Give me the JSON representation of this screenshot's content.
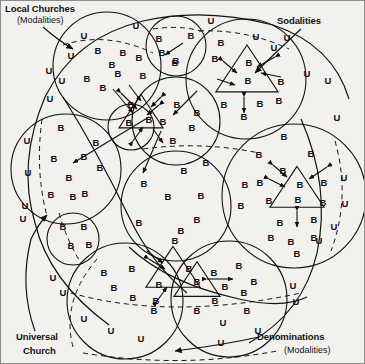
{
  "diagram": {
    "title_labels": {
      "local_churches": "Local Churches",
      "local_churches_sub": "(Modalities)",
      "sodalities": "Sodalities",
      "universal_church_line1": "Universal",
      "universal_church_line2": "Church",
      "denominations": "Denominations",
      "denominations_sub": "(Modalities)"
    },
    "glyphs": {
      "believer": "B",
      "unbeliever": "U"
    },
    "colors": {
      "background": "#f2f1ee",
      "ink": "#111111",
      "border": "#8d8d8a"
    },
    "shapes": {
      "circles": [
        {
          "name": "local-church-top-left",
          "cx": 106,
          "cy": 65,
          "r": 54
        },
        {
          "name": "local-church-top-center",
          "cx": 175,
          "cy": 45,
          "r": 30
        },
        {
          "name": "local-church-top-right",
          "cx": 245,
          "cy": 78,
          "r": 60
        },
        {
          "name": "local-church-mid-left",
          "cx": 65,
          "cy": 168,
          "r": 55
        },
        {
          "name": "local-church-mid-center",
          "cx": 175,
          "cy": 120,
          "r": 44
        },
        {
          "name": "local-church-small-upper",
          "cx": 130,
          "cy": 126,
          "r": 23
        },
        {
          "name": "local-church-small-lower",
          "cx": 72,
          "cy": 238,
          "r": 26
        },
        {
          "name": "local-church-center",
          "cx": 175,
          "cy": 205,
          "r": 55
        },
        {
          "name": "local-church-right",
          "cx": 293,
          "cy": 195,
          "r": 72
        },
        {
          "name": "local-church-bottom-left",
          "cx": 124,
          "cy": 300,
          "r": 58
        },
        {
          "name": "local-church-bottom-right",
          "cx": 228,
          "cy": 298,
          "r": 58
        }
      ],
      "triangles": [
        {
          "name": "sodality-top-left",
          "cx": 140,
          "cy": 112,
          "size": 27
        },
        {
          "name": "sodality-top-right",
          "cx": 246,
          "cy": 70,
          "size": 38
        },
        {
          "name": "sodality-right",
          "cx": 296,
          "cy": 188,
          "size": 33
        },
        {
          "name": "sodality-bottom-left",
          "cx": 172,
          "cy": 268,
          "size": 33
        },
        {
          "name": "sodality-bottom-right",
          "cx": 196,
          "cy": 280,
          "size": 28
        }
      ]
    },
    "believer_positions": [
      [
        97,
        50
      ],
      [
        122,
        52
      ],
      [
        138,
        57
      ],
      [
        111,
        64
      ],
      [
        117,
        73
      ],
      [
        86,
        78
      ],
      [
        142,
        75
      ],
      [
        102,
        87
      ],
      [
        158,
        38
      ],
      [
        190,
        35
      ],
      [
        161,
        52
      ],
      [
        175,
        60
      ],
      [
        174,
        62
      ],
      [
        220,
        42
      ],
      [
        248,
        62
      ],
      [
        247,
        80
      ],
      [
        214,
        58
      ],
      [
        280,
        81
      ],
      [
        278,
        100
      ],
      [
        223,
        104
      ],
      [
        259,
        103
      ],
      [
        243,
        116
      ],
      [
        60,
        127
      ],
      [
        95,
        142
      ],
      [
        53,
        158
      ],
      [
        83,
        156
      ],
      [
        99,
        167
      ],
      [
        68,
        177
      ],
      [
        84,
        193
      ],
      [
        50,
        194
      ],
      [
        72,
        196
      ],
      [
        176,
        104
      ],
      [
        196,
        112
      ],
      [
        162,
        121
      ],
      [
        191,
        127
      ],
      [
        172,
        140
      ],
      [
        130,
        104
      ],
      [
        128,
        122
      ],
      [
        148,
        119
      ],
      [
        62,
        226
      ],
      [
        83,
        226
      ],
      [
        70,
        245
      ],
      [
        88,
        244
      ],
      [
        183,
        170
      ],
      [
        143,
        183
      ],
      [
        167,
        196
      ],
      [
        200,
        195
      ],
      [
        205,
        162
      ],
      [
        196,
        219
      ],
      [
        138,
        222
      ],
      [
        180,
        230
      ],
      [
        174,
        240
      ],
      [
        283,
        136
      ],
      [
        258,
        154
      ],
      [
        310,
        153
      ],
      [
        282,
        170
      ],
      [
        244,
        184
      ],
      [
        259,
        182
      ],
      [
        299,
        184
      ],
      [
        297,
        199
      ],
      [
        323,
        182
      ],
      [
        240,
        205
      ],
      [
        268,
        200
      ],
      [
        322,
        202
      ],
      [
        279,
        222
      ],
      [
        313,
        219
      ],
      [
        270,
        237
      ],
      [
        290,
        241
      ],
      [
        313,
        237
      ],
      [
        296,
        253
      ],
      [
        103,
        272
      ],
      [
        131,
        268
      ],
      [
        113,
        287
      ],
      [
        132,
        297
      ],
      [
        158,
        284
      ],
      [
        155,
        300
      ],
      [
        153,
        310
      ],
      [
        188,
        268
      ],
      [
        196,
        281
      ],
      [
        213,
        272
      ],
      [
        238,
        265
      ],
      [
        224,
        286
      ],
      [
        243,
        292
      ],
      [
        253,
        281
      ],
      [
        196,
        310
      ],
      [
        214,
        300
      ],
      [
        246,
        310
      ]
    ],
    "unbeliever_positions": [
      [
        83,
        35
      ],
      [
        70,
        55
      ],
      [
        48,
        70
      ],
      [
        61,
        80
      ],
      [
        49,
        98
      ],
      [
        135,
        25
      ],
      [
        210,
        20
      ],
      [
        255,
        36
      ],
      [
        286,
        37
      ],
      [
        273,
        47
      ],
      [
        306,
        73
      ],
      [
        327,
        80
      ],
      [
        336,
        117
      ],
      [
        343,
        177
      ],
      [
        344,
        203
      ],
      [
        333,
        226
      ],
      [
        26,
        140
      ],
      [
        27,
        172
      ],
      [
        24,
        205
      ],
      [
        22,
        218
      ],
      [
        52,
        277
      ],
      [
        62,
        292
      ],
      [
        83,
        318
      ],
      [
        110,
        330
      ],
      [
        140,
        338
      ],
      [
        222,
        322
      ],
      [
        257,
        330
      ],
      [
        292,
        285
      ],
      [
        295,
        301
      ],
      [
        318,
        240
      ],
      [
        220,
        342
      ]
    ]
  }
}
